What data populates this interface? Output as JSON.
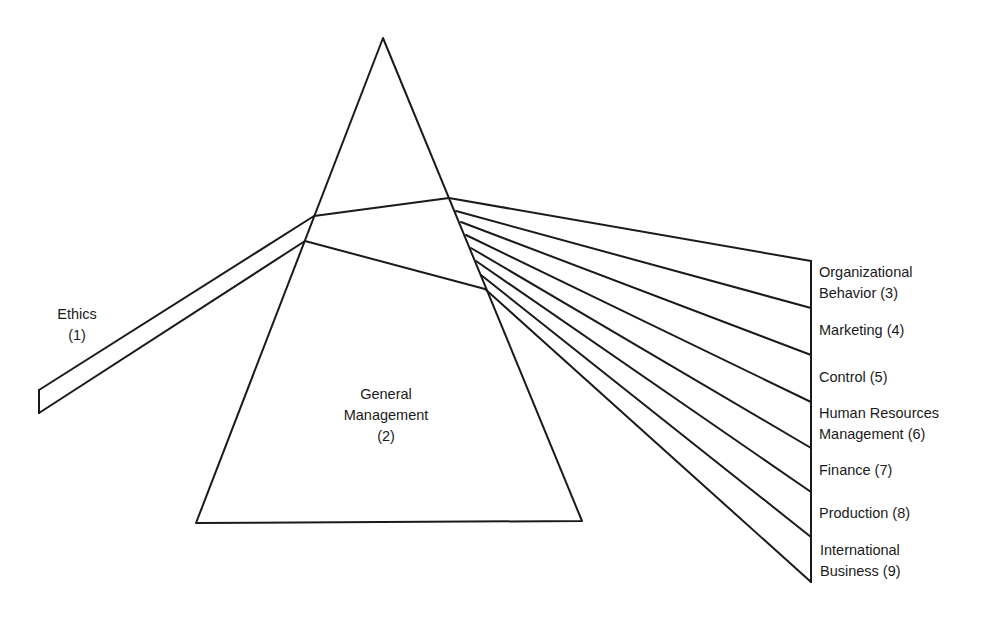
{
  "diagram": {
    "type": "prism",
    "stroke_color": "#1a1a1a",
    "background": "#ffffff",
    "prism": {
      "apex": [
        383,
        38
      ],
      "base_left": [
        196,
        523
      ],
      "base_right": [
        582,
        521
      ]
    },
    "input_beam": {
      "label_line1": "Ethics",
      "label_line2": "(1)",
      "upper": [
        [
          39,
          390
        ],
        [
          314,
          216
        ]
      ],
      "lower": [
        [
          39,
          413
        ],
        [
          305,
          241
        ]
      ]
    },
    "inner": {
      "label_line1": "General",
      "label_line2": "Management",
      "label_line3": "(2)",
      "upper": [
        [
          314,
          216
        ],
        [
          449,
          198
        ]
      ],
      "lower": [
        [
          305,
          241
        ],
        [
          485,
          289
        ]
      ]
    },
    "output_bar_x": 811,
    "rays": [
      {
        "from": [
          449,
          198
        ],
        "to": [
          811,
          261
        ]
      },
      {
        "from": [
          456,
          211
        ],
        "to": [
          811,
          308
        ]
      },
      {
        "from": [
          461,
          222
        ],
        "to": [
          811,
          355
        ]
      },
      {
        "from": [
          466,
          235
        ],
        "to": [
          811,
          402
        ]
      },
      {
        "from": [
          471,
          248
        ],
        "to": [
          811,
          448
        ]
      },
      {
        "from": [
          476,
          261
        ],
        "to": [
          811,
          492
        ]
      },
      {
        "from": [
          481,
          275
        ],
        "to": [
          811,
          537
        ]
      },
      {
        "from": [
          485,
          289
        ],
        "to": [
          811,
          582
        ]
      }
    ],
    "outputs": [
      {
        "line1": "Organizational",
        "line2": "Behavior (3)"
      },
      {
        "line1": "Marketing (4)"
      },
      {
        "line1": "Control (5)"
      },
      {
        "line1": "Human Resources",
        "line2": "Management (6)"
      },
      {
        "line1": "Finance (7)"
      },
      {
        "line1": "Production (8)"
      },
      {
        "line1": "International",
        "line2": "Business (9)"
      }
    ]
  }
}
